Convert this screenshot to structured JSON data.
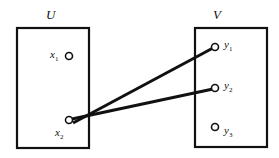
{
  "sets": {
    "U": {
      "label": "U",
      "elements": [
        {
          "name": "x",
          "sub": "1"
        },
        {
          "name": "x",
          "sub": "2"
        }
      ]
    },
    "V": {
      "label": "V",
      "elements": [
        {
          "name": "y",
          "sub": "1"
        },
        {
          "name": "y",
          "sub": "2"
        },
        {
          "name": "y",
          "sub": "3"
        }
      ]
    }
  },
  "mappings": [
    {
      "from": "x2",
      "to": "y1"
    },
    {
      "from": "x2",
      "to": "y2"
    }
  ],
  "colors": {
    "stroke": "#111111",
    "background": "#ffffff"
  }
}
